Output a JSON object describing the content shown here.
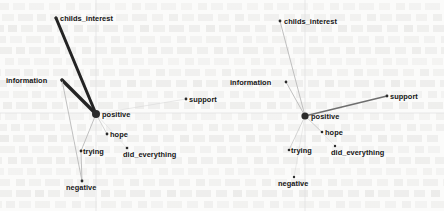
{
  "figure": {
    "type": "network-graph-pair",
    "background_note": "scanned page with faint bleed-through text",
    "panel_count": 2,
    "hub_node": "positive"
  },
  "colors": {
    "page_background": "#fbfbfa",
    "node_fill": "#2b2b2b",
    "label_text": "#151515",
    "edge_strong": "#242424",
    "edge_medium": "#6e6e6e",
    "edge_weak": "#b9b9b9",
    "edge_faint": "#d8d8d8",
    "axis_line": "#e0e0e0"
  },
  "chart_data": {
    "type": "scatter",
    "title": "",
    "xlabel": "",
    "ylabel": "",
    "grid": false,
    "legend": "none",
    "xlim": [
      0,
      222
    ],
    "ylim": [
      0,
      211
    ],
    "panels": [
      {
        "id": "left-panel",
        "name": "left",
        "axis_h_y": 113,
        "axis_v_x": 96,
        "nodes": [
          {
            "id": "childs_interest",
            "label": "childs_interest",
            "x": 56,
            "y": 18,
            "r": 1.5,
            "label_dx": 4,
            "label_dy": -3.5
          },
          {
            "id": "information",
            "label": "information",
            "x": 62,
            "y": 80,
            "r": 1.5,
            "label_dx": -56,
            "label_dy": -3.5
          },
          {
            "id": "positive",
            "label": "positive",
            "x": 96,
            "y": 114,
            "r": 4.0,
            "label_dx": 6,
            "label_dy": -3.5
          },
          {
            "id": "support",
            "label": "support",
            "x": 186,
            "y": 99,
            "r": 1.4,
            "label_dx": 3,
            "label_dy": -3.5
          },
          {
            "id": "hope",
            "label": "hope",
            "x": 107,
            "y": 134,
            "r": 1.4,
            "label_dx": 3,
            "label_dy": -3.5
          },
          {
            "id": "trying",
            "label": "trying",
            "x": 81,
            "y": 151,
            "r": 1.4,
            "label_dx": 2,
            "label_dy": -3.5
          },
          {
            "id": "did_everything",
            "label": "did_everything",
            "x": 127,
            "y": 148,
            "r": 1.3,
            "label_dx": -4,
            "label_dy": 2.5
          },
          {
            "id": "negative",
            "label": "negative",
            "x": 82,
            "y": 181,
            "r": 1.4,
            "label_dx": -16,
            "label_dy": 2.5
          }
        ],
        "edges": [
          {
            "from": "childs_interest",
            "to": "positive",
            "width": 3.0,
            "color_key": "edge_strong"
          },
          {
            "from": "information",
            "to": "positive",
            "width": 3.4,
            "color_key": "edge_strong"
          },
          {
            "from": "positive",
            "to": "support",
            "width": 0.6,
            "color_key": "edge_faint"
          },
          {
            "from": "positive",
            "to": "hope",
            "width": 0.6,
            "color_key": "edge_weak"
          },
          {
            "from": "positive",
            "to": "trying",
            "width": 0.9,
            "color_key": "edge_weak"
          },
          {
            "from": "positive",
            "to": "did_everything",
            "width": 0.5,
            "color_key": "edge_faint"
          },
          {
            "from": "information",
            "to": "negative",
            "width": 0.9,
            "color_key": "edge_weak"
          },
          {
            "from": "trying",
            "to": "negative",
            "width": 0.9,
            "color_key": "edge_weak"
          }
        ]
      },
      {
        "id": "right-panel",
        "name": "right",
        "axis_h_y": 113,
        "axis_v_x": 83,
        "nodes": [
          {
            "id": "childs_interest",
            "label": "childs_interest",
            "x": 58,
            "y": 21,
            "r": 1.4,
            "label_dx": 4,
            "label_dy": -3.5
          },
          {
            "id": "information",
            "label": "information",
            "x": 64,
            "y": 82,
            "r": 1.4,
            "label_dx": -56,
            "label_dy": -3.5
          },
          {
            "id": "positive",
            "label": "positive",
            "x": 83,
            "y": 116,
            "r": 3.6,
            "label_dx": 6,
            "label_dy": -3.5
          },
          {
            "id": "support",
            "label": "support",
            "x": 165,
            "y": 96,
            "r": 1.4,
            "label_dx": 3,
            "label_dy": -3.5
          },
          {
            "id": "hope",
            "label": "hope",
            "x": 100,
            "y": 132,
            "r": 1.3,
            "label_dx": 3,
            "label_dy": -3.5
          },
          {
            "id": "trying",
            "label": "trying",
            "x": 67,
            "y": 150,
            "r": 1.3,
            "label_dx": 2,
            "label_dy": -3.5
          },
          {
            "id": "did_everything",
            "label": "did_everything",
            "x": 113,
            "y": 146,
            "r": 1.2,
            "label_dx": -4,
            "label_dy": 2.5
          },
          {
            "id": "negative",
            "label": "negative",
            "x": 72,
            "y": 177,
            "r": 1.2,
            "label_dx": -16,
            "label_dy": 2.5
          }
        ],
        "edges": [
          {
            "from": "childs_interest",
            "to": "positive",
            "width": 0.9,
            "color_key": "edge_weak"
          },
          {
            "from": "information",
            "to": "positive",
            "width": 0.9,
            "color_key": "edge_weak"
          },
          {
            "from": "positive",
            "to": "support",
            "width": 1.5,
            "color_key": "edge_medium"
          },
          {
            "from": "positive",
            "to": "hope",
            "width": 0.6,
            "color_key": "edge_weak"
          },
          {
            "from": "positive",
            "to": "trying",
            "width": 0.6,
            "color_key": "edge_weak"
          },
          {
            "from": "positive",
            "to": "did_everything",
            "width": 0.4,
            "color_key": "edge_faint"
          },
          {
            "from": "positive",
            "to": "negative",
            "width": 0.5,
            "color_key": "edge_faint"
          }
        ]
      }
    ]
  }
}
